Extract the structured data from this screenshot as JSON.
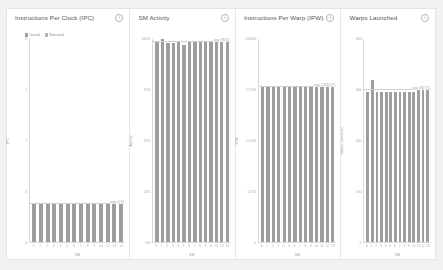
{
  "background": "#f2f2f2",
  "panel_background": "#ffffff",
  "bar_color": "#9e9e9e",
  "bar_color_alt": "#b4b4b4",
  "info_icon_glyph": "i",
  "icons": {
    "info": "info-icon"
  },
  "charts": [
    {
      "id": "ipc",
      "title": "Instructions Per Clock (IPC)",
      "legend": [
        {
          "label": "Issued",
          "color": "#9e9e9e"
        },
        {
          "label": "Executed",
          "color": "#b4b4b4"
        }
      ],
      "chart_data": {
        "type": "bar",
        "title": "Instructions Per Clock (IPC)",
        "xlabel": "SM",
        "ylabel": "IPC",
        "categories": [
          "0",
          "1",
          "2",
          "3",
          "4",
          "5",
          "6",
          "7",
          "8",
          "9",
          "10",
          "11",
          "12",
          "13"
        ],
        "values": [
          0.74,
          0.74,
          0.74,
          0.74,
          0.74,
          0.74,
          0.74,
          0.74,
          0.74,
          0.74,
          0.74,
          0.74,
          0.76,
          0.76
        ],
        "series": [
          {
            "name": "Issued",
            "values": [
              0.74,
              0.74,
              0.74,
              0.74,
              0.74,
              0.74,
              0.74,
              0.74,
              0.74,
              0.74,
              0.74,
              0.74,
              0.76,
              0.76
            ]
          },
          {
            "name": "Executed",
            "values": [
              0.73,
              0.73,
              0.73,
              0.73,
              0.73,
              0.73,
              0.73,
              0.73,
              0.73,
              0.73,
              0.73,
              0.73,
              0.75,
              0.75
            ]
          }
        ],
        "ylim": [
          0,
          4
        ],
        "yticks": [
          "0",
          "1",
          "2",
          "3",
          "4"
        ],
        "grid": false,
        "legend_position": "top-left",
        "annotations": [
          {
            "text": "avg: 0.74",
            "value": 0.74
          }
        ]
      }
    },
    {
      "id": "sm_activity",
      "title": "SM Activity",
      "legend": [],
      "chart_data": {
        "type": "bar",
        "title": "SM Activity",
        "xlabel": "SM",
        "ylabel": "Activity",
        "categories": [
          "0",
          "1",
          "2",
          "3",
          "4",
          "5",
          "6",
          "7",
          "8",
          "9",
          "10",
          "11",
          "12",
          "13"
        ],
        "values": [
          98.5,
          99.8,
          98.2,
          98.0,
          98.6,
          97.2,
          98.4,
          98.6,
          98.5,
          98.7,
          98.6,
          98.5,
          98.6,
          98.5
        ],
        "ylim": [
          0,
          100
        ],
        "yticks": [
          "100%",
          "75%",
          "50%",
          "25%",
          "0%"
        ],
        "grid": false,
        "legend_position": "none",
        "annotations": [
          {
            "text": "avg: 98.52",
            "value": 98.52
          }
        ]
      }
    },
    {
      "id": "ipw",
      "title": "Instructions Per Warp (IPW)",
      "legend": [],
      "chart_data": {
        "type": "bar",
        "title": "Instructions Per Warp (IPW)",
        "xlabel": "SM",
        "ylabel": "IPW",
        "categories": [
          "0",
          "1",
          "2",
          "3",
          "4",
          "5",
          "6",
          "7",
          "8",
          "9",
          "10",
          "11",
          "12",
          "13"
        ],
        "values": [
          17550,
          17550,
          17550,
          17550,
          17550,
          17550,
          17550,
          17550,
          17550,
          17550,
          17560,
          17565,
          17570,
          17570
        ],
        "ylim": [
          0,
          23000
        ],
        "yticks": [
          "23,000",
          "17,250",
          "11,500",
          "5,750",
          "0"
        ],
        "grid": false,
        "legend_position": "none",
        "annotations": [
          {
            "text": "avg: 17561.57",
            "value": 17561.57
          }
        ]
      }
    },
    {
      "id": "warps_launched",
      "title": "Warps Launched",
      "legend": [],
      "chart_data": {
        "type": "bar",
        "title": "Warps Launched",
        "xlabel": "SM",
        "ylabel": "Warps Launched",
        "categories": [
          "0",
          "1",
          "2",
          "3",
          "4",
          "5",
          "6",
          "7",
          "8",
          "9",
          "10",
          "11",
          "12",
          "13"
        ],
        "values": [
          592,
          640,
          592,
          592,
          592,
          592,
          592,
          592,
          592,
          592,
          592,
          600,
          608,
          600
        ],
        "ylim": [
          0,
          800
        ],
        "yticks": [
          "800",
          "600",
          "400",
          "200",
          "0"
        ],
        "grid": false,
        "legend_position": "none",
        "annotations": [
          {
            "text": "avg: 597.71",
            "value": 597.71
          }
        ]
      }
    }
  ]
}
